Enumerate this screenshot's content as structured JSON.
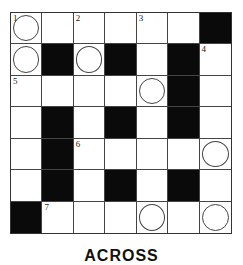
{
  "puzzle": {
    "rows": 7,
    "cols": 7,
    "grid": [
      [
        {
          "n": "1",
          "c": true
        },
        {},
        {
          "n": "2"
        },
        {},
        {
          "n": "3"
        },
        {},
        {
          "b": true
        }
      ],
      [
        {
          "c": true
        },
        {
          "b": true
        },
        {
          "c": true
        },
        {
          "b": true
        },
        {},
        {
          "b": true
        },
        {
          "n": "4"
        }
      ],
      [
        {
          "n": "5"
        },
        {},
        {},
        {},
        {
          "c": true
        },
        {
          "b": true
        },
        {}
      ],
      [
        {},
        {
          "b": true
        },
        {},
        {
          "b": true
        },
        {},
        {
          "b": true
        },
        {}
      ],
      [
        {},
        {
          "b": true
        },
        {
          "n": "6"
        },
        {},
        {},
        {},
        {
          "c": true
        }
      ],
      [
        {},
        {
          "b": true
        },
        {},
        {
          "b": true
        },
        {},
        {
          "b": true
        },
        {}
      ],
      [
        {
          "b": true
        },
        {
          "n": "7"
        },
        {},
        {},
        {
          "c": true
        },
        {},
        {
          "c": true
        }
      ]
    ]
  },
  "clues": {
    "heading": "ACROSS"
  },
  "colors": {
    "block": "#0a0a0a",
    "line": "#444444",
    "background": "#ffffff"
  }
}
